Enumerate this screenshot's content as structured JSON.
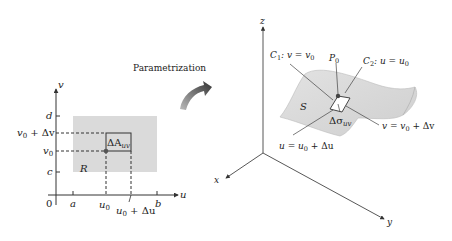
{
  "left_panel": {
    "axis_u_label": "u",
    "axis_v_label": "v",
    "origin_label": "0",
    "u_ticks": {
      "a": "a",
      "u0": "u",
      "u0_sub": "0",
      "u0du": "u",
      "u0du_sub": "0",
      "u0du_rest": " + Δu",
      "b": "b"
    },
    "v_ticks": {
      "d": "d",
      "v0dv": "v",
      "v0dv_sub": "0",
      "v0dv_rest": " + Δv",
      "v0": "v",
      "v0_sub": "0",
      "c": "c"
    },
    "region_label": "R",
    "patch_label": "ΔA",
    "patch_sub": "uv",
    "region_color": "#d9d9d9"
  },
  "arrow": {
    "label": "Parametrization",
    "color": "#444444"
  },
  "right_panel": {
    "axis_x_label": "x",
    "axis_y_label": "y",
    "axis_z_label": "z",
    "surface_label": "S",
    "point_label": "P",
    "point_sub": "0",
    "curve1_label": "C",
    "curve1_sub": "1",
    "curve1_rest": ": v = v",
    "curve1_rest_sub": "0",
    "curve2_label": "C",
    "curve2_sub": "2",
    "curve2_rest": ": u = u",
    "curve2_rest_sub": "0",
    "patch_label": "Δσ",
    "patch_sub": "uv",
    "line_v_label": "v = v",
    "line_v_sub": "0",
    "line_v_rest": " + Δv",
    "line_u_label": "u = u",
    "line_u_sub": "0",
    "line_u_rest": " + Δu",
    "surface_color": "#d4d4d4"
  }
}
